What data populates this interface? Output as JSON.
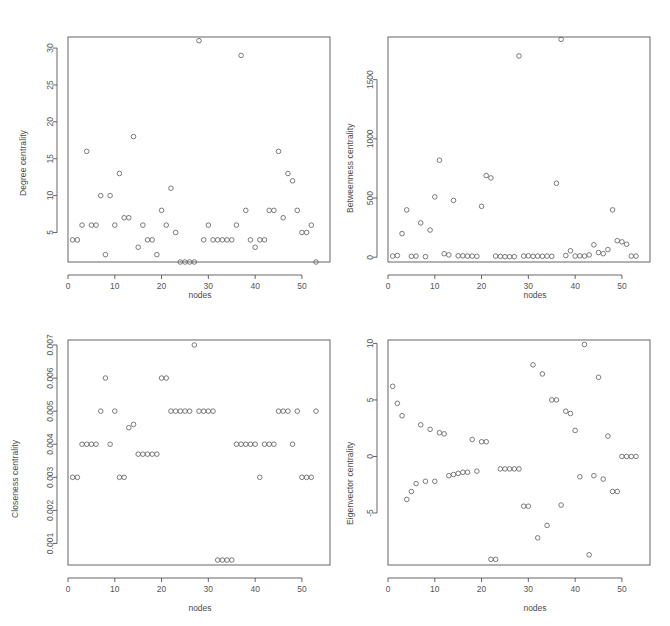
{
  "figure": {
    "layout": "2x2 panel grid of scatter plots",
    "background": "#ffffff",
    "point_color": "#5a5a5a",
    "axis_color": "#555555"
  },
  "chart_data": [
    {
      "type": "scatter",
      "panel": "top-left",
      "title": "",
      "xlabel": "nodes",
      "ylabel": "Degree centrality",
      "xlim": [
        0,
        56
      ],
      "ylim": [
        1,
        31.5
      ],
      "xticks": [
        0,
        10,
        20,
        30,
        40,
        50
      ],
      "yticks": [
        5,
        10,
        15,
        20,
        25,
        30
      ],
      "grid": false,
      "legend": "none",
      "x": [
        1,
        2,
        3,
        4,
        5,
        6,
        7,
        8,
        9,
        10,
        11,
        12,
        13,
        14,
        15,
        16,
        17,
        18,
        19,
        20,
        21,
        22,
        23,
        24,
        25,
        26,
        27,
        28,
        29,
        30,
        31,
        32,
        33,
        34,
        35,
        36,
        37,
        38,
        39,
        40,
        41,
        42,
        43,
        44,
        45,
        46,
        47,
        48,
        49,
        50,
        51,
        52,
        53
      ],
      "y": [
        4,
        4,
        6,
        16,
        6,
        6,
        10,
        2,
        10,
        6,
        13,
        7,
        7,
        18,
        3,
        6,
        4,
        4,
        2,
        8,
        6,
        11,
        5,
        1,
        1,
        1,
        1,
        31,
        4,
        6,
        4,
        4,
        4,
        4,
        4,
        6,
        29,
        8,
        4,
        3,
        4,
        4,
        8,
        8,
        16,
        7,
        13,
        12,
        8,
        5,
        5,
        6,
        1
      ]
    },
    {
      "type": "scatter",
      "panel": "top-right",
      "title": "",
      "xlabel": "nodes",
      "ylabel": "Betweenness centrality",
      "xlim": [
        0,
        56
      ],
      "ylim": [
        -40,
        1860
      ],
      "xticks": [
        0,
        10,
        20,
        30,
        40,
        50
      ],
      "yticks": [
        0,
        500,
        1000,
        1500
      ],
      "grid": false,
      "legend": "none",
      "x": [
        1,
        2,
        3,
        4,
        5,
        6,
        7,
        8,
        9,
        10,
        11,
        12,
        13,
        14,
        15,
        16,
        17,
        18,
        19,
        20,
        21,
        22,
        23,
        24,
        25,
        26,
        27,
        28,
        29,
        30,
        31,
        32,
        33,
        34,
        35,
        36,
        37,
        38,
        39,
        40,
        41,
        42,
        43,
        44,
        45,
        46,
        47,
        48,
        49,
        50,
        51,
        52,
        53
      ],
      "y": [
        10,
        15,
        200,
        400,
        8,
        10,
        290,
        5,
        230,
        510,
        820,
        30,
        20,
        480,
        12,
        12,
        10,
        10,
        8,
        430,
        690,
        670,
        10,
        8,
        5,
        5,
        5,
        1700,
        10,
        12,
        8,
        10,
        8,
        10,
        8,
        625,
        1840,
        15,
        55,
        10,
        12,
        10,
        20,
        105,
        40,
        30,
        65,
        400,
        140,
        130,
        110,
        10,
        10
      ]
    },
    {
      "type": "scatter",
      "panel": "bottom-left",
      "title": "",
      "xlabel": "nodes",
      "ylabel": "Closeness centrality",
      "xlim": [
        0,
        56
      ],
      "ylim": [
        0.00035,
        0.00715
      ],
      "xticks": [
        0,
        10,
        20,
        30,
        40,
        50
      ],
      "yticks": [
        0.001,
        0.002,
        0.003,
        0.004,
        0.005,
        0.006,
        0.007
      ],
      "grid": false,
      "legend": "none",
      "x": [
        1,
        2,
        3,
        4,
        5,
        6,
        7,
        8,
        9,
        10,
        11,
        12,
        13,
        14,
        15,
        16,
        17,
        18,
        19,
        20,
        21,
        22,
        23,
        24,
        25,
        26,
        27,
        28,
        29,
        30,
        31,
        32,
        33,
        34,
        35,
        36,
        37,
        38,
        39,
        40,
        41,
        42,
        43,
        44,
        45,
        46,
        47,
        48,
        49,
        50,
        51,
        52,
        53
      ],
      "y": [
        0.003,
        0.003,
        0.004,
        0.004,
        0.004,
        0.004,
        0.005,
        0.006,
        0.004,
        0.005,
        0.003,
        0.003,
        0.0045,
        0.0046,
        0.0037,
        0.0037,
        0.0037,
        0.0037,
        0.0037,
        0.006,
        0.006,
        0.005,
        0.005,
        0.005,
        0.005,
        0.005,
        0.007,
        0.005,
        0.005,
        0.005,
        0.005,
        0.0005,
        0.0005,
        0.0005,
        0.0005,
        0.004,
        0.004,
        0.004,
        0.004,
        0.004,
        0.003,
        0.004,
        0.004,
        0.004,
        0.005,
        0.005,
        0.005,
        0.004,
        0.005,
        0.003,
        0.003,
        0.003,
        0.005
      ]
    },
    {
      "type": "scatter",
      "panel": "bottom-right",
      "title": "",
      "xlabel": "nodes",
      "ylabel": "Eigenvector centrality",
      "xlim": [
        0,
        56
      ],
      "ylim": [
        -9.6,
        10.3
      ],
      "xticks": [
        0,
        10,
        20,
        30,
        40,
        50
      ],
      "yticks": [
        -5,
        0,
        5,
        10
      ],
      "grid": false,
      "legend": "none",
      "x": [
        1,
        2,
        3,
        4,
        5,
        6,
        7,
        8,
        9,
        10,
        11,
        12,
        13,
        14,
        15,
        16,
        17,
        18,
        19,
        20,
        21,
        22,
        23,
        24,
        25,
        26,
        27,
        28,
        29,
        30,
        31,
        32,
        33,
        34,
        35,
        36,
        37,
        38,
        39,
        40,
        41,
        42,
        43,
        44,
        45,
        46,
        47,
        48,
        49,
        50,
        51,
        52,
        53
      ],
      "y": [
        6.2,
        4.7,
        3.6,
        -3.8,
        -3.1,
        -2.4,
        2.8,
        -2.2,
        2.4,
        -2.2,
        2.1,
        2.0,
        -1.7,
        -1.6,
        -1.5,
        -1.4,
        -1.4,
        1.5,
        -1.3,
        1.3,
        1.3,
        -9.1,
        -9.1,
        -1.1,
        -1.1,
        -1.1,
        -1.1,
        -1.1,
        -4.4,
        -4.4,
        8.1,
        -7.2,
        7.3,
        -6.1,
        5.0,
        5.0,
        -4.3,
        4.0,
        3.8,
        2.3,
        -1.8,
        9.9,
        -8.7,
        -1.7,
        7.0,
        -2.0,
        1.8,
        -3.1,
        -3.1,
        0,
        0,
        0,
        0
      ]
    }
  ]
}
